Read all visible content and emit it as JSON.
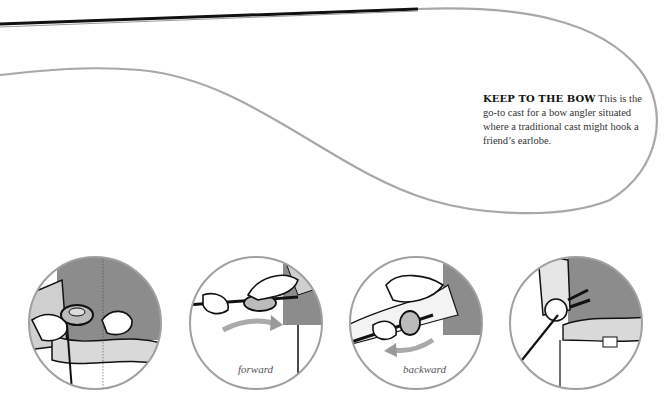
{
  "caption": {
    "heading": "KEEP TO THE BOW",
    "body": "This is the go-to cast for a bow angler situated where a traditional cast might hook a friend’s earlobe."
  },
  "panels": [
    {
      "id": 1,
      "label": ""
    },
    {
      "id": 2,
      "label": "forward"
    },
    {
      "id": 3,
      "label": "backward"
    },
    {
      "id": 4,
      "label": ""
    }
  ],
  "colors": {
    "line": "#a8a8a8",
    "rod": "#111111",
    "circle_border": "#a0a0a0",
    "shirt": "#8a8a8a",
    "skin": "#ffffff"
  }
}
